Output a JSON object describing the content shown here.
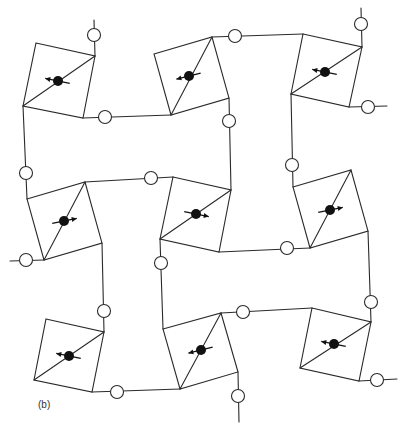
{
  "figure": {
    "label": "(b)",
    "colors": {
      "line": "#2a2a2a",
      "filled": "#111111",
      "background": "#ffffff"
    },
    "squares": [
      {
        "id": "top-left",
        "corners": [
          [
            36,
            43
          ],
          [
            95,
            56
          ],
          [
            83,
            118
          ],
          [
            23,
            106
          ]
        ],
        "diag": [
          [
            23,
            106
          ],
          [
            95,
            56
          ]
        ],
        "spin": {
          "c": [
            58,
            81
          ],
          "dir": [
            -1,
            -0.2
          ]
        }
      },
      {
        "id": "top-middle",
        "corners": [
          [
            154,
            54
          ],
          [
            212,
            37
          ],
          [
            229,
            98
          ],
          [
            171,
            115
          ]
        ],
        "diag": [
          [
            171,
            115
          ],
          [
            212,
            37
          ]
        ],
        "spin": {
          "c": [
            189,
            76
          ],
          "dir": [
            -1,
            0.25
          ]
        }
      },
      {
        "id": "top-right",
        "corners": [
          [
            303,
            34
          ],
          [
            362,
            47
          ],
          [
            349,
            107
          ],
          [
            291,
            94
          ]
        ],
        "diag": [
          [
            291,
            94
          ],
          [
            362,
            47
          ]
        ],
        "spin": {
          "c": [
            325,
            72
          ],
          "dir": [
            -1,
            -0.2
          ]
        }
      },
      {
        "id": "middle-left",
        "corners": [
          [
            27,
            199
          ],
          [
            85,
            182
          ],
          [
            102,
            243
          ],
          [
            44,
            260
          ]
        ],
        "diag": [
          [
            44,
            260
          ],
          [
            85,
            182
          ]
        ],
        "spin": {
          "c": [
            64,
            221
          ],
          "dir": [
            1,
            -0.2
          ]
        }
      },
      {
        "id": "center",
        "corners": [
          [
            173,
            177
          ],
          [
            231,
            190
          ],
          [
            219,
            252
          ],
          [
            160,
            239
          ]
        ],
        "diag": [
          [
            160,
            239
          ],
          [
            231,
            190
          ]
        ],
        "spin": {
          "c": [
            196,
            214
          ],
          "dir": [
            1,
            0.2
          ]
        }
      },
      {
        "id": "middle-right",
        "corners": [
          [
            293,
            187
          ],
          [
            351,
            170
          ],
          [
            368,
            231
          ],
          [
            310,
            248
          ]
        ],
        "diag": [
          [
            310,
            248
          ],
          [
            351,
            170
          ]
        ],
        "spin": {
          "c": [
            330,
            210
          ],
          "dir": [
            1,
            -0.2
          ]
        }
      },
      {
        "id": "bottom-left",
        "corners": [
          [
            46,
            319
          ],
          [
            104,
            332
          ],
          [
            92,
            392
          ],
          [
            34,
            380
          ]
        ],
        "diag": [
          [
            34,
            380
          ],
          [
            104,
            332
          ]
        ],
        "spin": {
          "c": [
            69,
            356
          ],
          "dir": [
            -1,
            -0.2
          ]
        }
      },
      {
        "id": "bottom-middle",
        "corners": [
          [
            163,
            329
          ],
          [
            221,
            313
          ],
          [
            238,
            372
          ],
          [
            180,
            389
          ]
        ],
        "diag": [
          [
            180,
            389
          ],
          [
            221,
            313
          ]
        ],
        "spin": {
          "c": [
            201,
            350
          ],
          "dir": [
            -1,
            0.25
          ]
        }
      },
      {
        "id": "bottom-right",
        "corners": [
          [
            312,
            308
          ],
          [
            371,
            322
          ],
          [
            359,
            381
          ],
          [
            300,
            368
          ]
        ],
        "diag": [
          [
            300,
            368
          ],
          [
            371,
            322
          ]
        ],
        "spin": {
          "c": [
            334,
            344
          ],
          "dir": [
            -1,
            -0.2
          ]
        }
      }
    ],
    "edges": [
      [
        [
          94,
          20
        ],
        [
          95,
          56
        ]
      ],
      [
        [
          83,
          118
        ],
        [
          171,
          115
        ]
      ],
      [
        [
          212,
          37
        ],
        [
          303,
          34
        ]
      ],
      [
        [
          361,
          8
        ],
        [
          362,
          47
        ]
      ],
      [
        [
          349,
          107
        ],
        [
          387,
          106
        ]
      ],
      [
        [
          23,
          106
        ],
        [
          27,
          199
        ]
      ],
      [
        [
          85,
          182
        ],
        [
          173,
          177
        ]
      ],
      [
        [
          229,
          98
        ],
        [
          231,
          190
        ]
      ],
      [
        [
          291,
          94
        ],
        [
          293,
          187
        ]
      ],
      [
        [
          10,
          261
        ],
        [
          44,
          260
        ]
      ],
      [
        [
          219,
          252
        ],
        [
          310,
          248
        ]
      ],
      [
        [
          102,
          243
        ],
        [
          104,
          332
        ]
      ],
      [
        [
          160,
          239
        ],
        [
          163,
          329
        ]
      ],
      [
        [
          368,
          231
        ],
        [
          371,
          322
        ]
      ],
      [
        [
          92,
          392
        ],
        [
          180,
          389
        ]
      ],
      [
        [
          221,
          313
        ],
        [
          312,
          308
        ]
      ],
      [
        [
          238,
          372
        ],
        [
          239,
          422
        ]
      ],
      [
        [
          359,
          381
        ],
        [
          397,
          379
        ]
      ]
    ],
    "open_nodes": [
      [
        94,
        35
      ],
      [
        105,
        117
      ],
      [
        235,
        36
      ],
      [
        361,
        24
      ],
      [
        368,
        107
      ],
      [
        26,
        173
      ],
      [
        151,
        178
      ],
      [
        229,
        121
      ],
      [
        292,
        165
      ],
      [
        26,
        260
      ],
      [
        287,
        248
      ],
      [
        161,
        263
      ],
      [
        104,
        311
      ],
      [
        371,
        302
      ],
      [
        117,
        392
      ],
      [
        243,
        312
      ],
      [
        238,
        396
      ],
      [
        377,
        380
      ]
    ],
    "node_radius": 6.5,
    "spin_radius": 5
  }
}
